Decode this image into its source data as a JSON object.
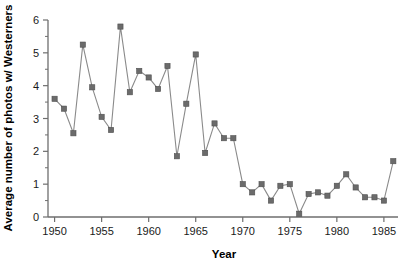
{
  "chart_data": {
    "type": "line",
    "title": "",
    "xlabel": "Year",
    "ylabel": "Average number of photos w/ Westerners",
    "xlim": [
      1949.3,
      1986.5
    ],
    "ylim": [
      0,
      6
    ],
    "grid": false,
    "legend": null,
    "marker": "square",
    "line_color": "#8a8a8a",
    "marker_color": "#6b6b6b",
    "x_ticks": [
      1950,
      1955,
      1960,
      1965,
      1970,
      1975,
      1980,
      1985
    ],
    "x_tick_labels": [
      "1950",
      "1955",
      "1960",
      "1965",
      "1970",
      "1975",
      "1980",
      "1985"
    ],
    "x_minor_tick_step": 1,
    "y_ticks": [
      0,
      1,
      2,
      3,
      4,
      5,
      6
    ],
    "y_tick_labels": [
      "0",
      "1",
      "2",
      "3",
      "4",
      "5",
      "6"
    ],
    "y_minor_tick_step": 0.5,
    "x": [
      1950,
      1951,
      1952,
      1953,
      1954,
      1955,
      1956,
      1957,
      1958,
      1959,
      1960,
      1961,
      1962,
      1963,
      1964,
      1965,
      1966,
      1967,
      1968,
      1969,
      1970,
      1971,
      1972,
      1973,
      1974,
      1975,
      1976,
      1977,
      1978,
      1979,
      1980,
      1981,
      1982,
      1983,
      1984,
      1985,
      1986
    ],
    "values": [
      3.6,
      3.3,
      2.55,
      5.25,
      3.95,
      3.05,
      2.65,
      5.8,
      3.8,
      4.45,
      4.25,
      3.9,
      4.6,
      1.85,
      3.45,
      4.95,
      1.95,
      2.85,
      2.4,
      2.4,
      1.0,
      0.75,
      1.0,
      0.5,
      0.95,
      1.0,
      0.1,
      0.7,
      0.75,
      0.65,
      0.95,
      1.3,
      0.9,
      0.6,
      0.6,
      0.5,
      1.7
    ],
    "series": [
      {
        "name": "Average number of photos w/ Westerners",
        "values": [
          3.6,
          3.3,
          2.55,
          5.25,
          3.95,
          3.05,
          2.65,
          5.8,
          3.8,
          4.45,
          4.25,
          3.9,
          4.6,
          1.85,
          3.45,
          4.95,
          1.95,
          2.85,
          2.4,
          2.4,
          1.0,
          0.75,
          1.0,
          0.5,
          0.95,
          1.0,
          0.1,
          0.7,
          0.75,
          0.65,
          0.95,
          1.3,
          0.9,
          0.6,
          0.6,
          0.5,
          1.7
        ]
      }
    ]
  }
}
